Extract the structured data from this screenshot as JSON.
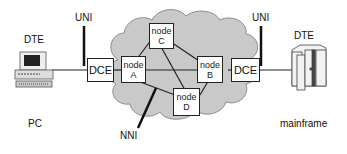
{
  "diagram": {
    "left": {
      "dte_label": "DTE",
      "device_label": "PC",
      "uni_label": "UNI",
      "dce_label": "DCE"
    },
    "right": {
      "dte_label": "DTE",
      "device_label": "mainframe",
      "uni_label": "UNI",
      "dce_label": "DCE"
    },
    "nni_label": "NNI",
    "nodes": [
      {
        "id": "A",
        "line1": "node",
        "line2": "A"
      },
      {
        "id": "B",
        "line1": "node",
        "line2": "B"
      },
      {
        "id": "C",
        "line1": "node",
        "line2": "C"
      },
      {
        "id": "D",
        "line1": "node",
        "line2": "D"
      }
    ],
    "links": [
      [
        "A",
        "C"
      ],
      [
        "A",
        "B"
      ],
      [
        "A",
        "D"
      ],
      [
        "C",
        "B"
      ],
      [
        "C",
        "D"
      ],
      [
        "B",
        "D"
      ]
    ],
    "colors": {
      "cloud_fill": "#c8c8c8",
      "cloud_stroke": "#8a8a8a",
      "line": "#222222"
    }
  }
}
